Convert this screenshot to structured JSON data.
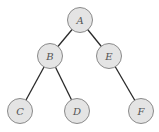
{
  "diagram": {
    "type": "binary-tree",
    "colors": {
      "node_fill": "#e4e4e4",
      "node_stroke": "#8a8a8a",
      "edge": "#2a2a2a",
      "label": "#555555"
    },
    "nodes": [
      {
        "id": "A",
        "label": "A",
        "x": 80,
        "y": 20
      },
      {
        "id": "B",
        "label": "B",
        "x": 50,
        "y": 56
      },
      {
        "id": "E",
        "label": "E",
        "x": 109,
        "y": 56
      },
      {
        "id": "C",
        "label": "C",
        "x": 20,
        "y": 111
      },
      {
        "id": "D",
        "label": "D",
        "x": 77,
        "y": 111
      },
      {
        "id": "F",
        "label": "F",
        "x": 141,
        "y": 111
      }
    ],
    "edges": [
      {
        "from": "A",
        "to": "B"
      },
      {
        "from": "A",
        "to": "E"
      },
      {
        "from": "B",
        "to": "C"
      },
      {
        "from": "B",
        "to": "D"
      },
      {
        "from": "E",
        "to": "F"
      }
    ],
    "node_radius": 12.5
  }
}
